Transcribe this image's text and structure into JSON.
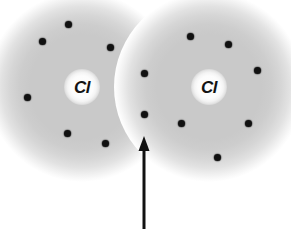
{
  "figure": {
    "background_color": "#ffffff",
    "width": 291,
    "height": 229
  },
  "atoms": [
    {
      "id": "left-atom",
      "label": "Cl",
      "cloud": {
        "cx": 82,
        "cy": 87,
        "r": 95,
        "color": "#c9c9c9"
      },
      "nucleus": {
        "cx": 82,
        "cy": 87,
        "r": 18,
        "color": "#fcfcfc"
      }
    },
    {
      "id": "right-atom",
      "label": "Cl",
      "cloud": {
        "cx": 209,
        "cy": 87,
        "r": 95,
        "color": "#c9c9c9"
      },
      "nucleus": {
        "cx": 209,
        "cy": 87,
        "r": 18,
        "color": "#fcfcfc"
      }
    }
  ],
  "electrons": {
    "color": "#111111",
    "radius": 3.5,
    "left_atom": [
      {
        "cx": 68,
        "cy": 24
      },
      {
        "cx": 42,
        "cy": 41
      },
      {
        "cx": 110,
        "cy": 47
      },
      {
        "cx": 27,
        "cy": 97
      },
      {
        "cx": 67,
        "cy": 133
      },
      {
        "cx": 105,
        "cy": 143
      }
    ],
    "right_atom": [
      {
        "cx": 190,
        "cy": 36
      },
      {
        "cx": 228,
        "cy": 44
      },
      {
        "cx": 257,
        "cy": 70
      },
      {
        "cx": 181,
        "cy": 123
      },
      {
        "cx": 248,
        "cy": 123
      },
      {
        "cx": 217,
        "cy": 157
      }
    ],
    "shared_pair": [
      {
        "cx": 144,
        "cy": 73,
        "role": "bonding-electron-upper"
      },
      {
        "cx": 144,
        "cy": 114,
        "role": "bonding-electron-lower"
      }
    ]
  },
  "annotation": {
    "arrow": {
      "name": "bonding-pair-pointer",
      "color": "#111111",
      "tail_x": 144,
      "tail_y": 229,
      "tip_x": 144,
      "tip_y": 136,
      "shaft_width": 3,
      "head_width": 11,
      "head_length": 15
    },
    "caption": ""
  }
}
